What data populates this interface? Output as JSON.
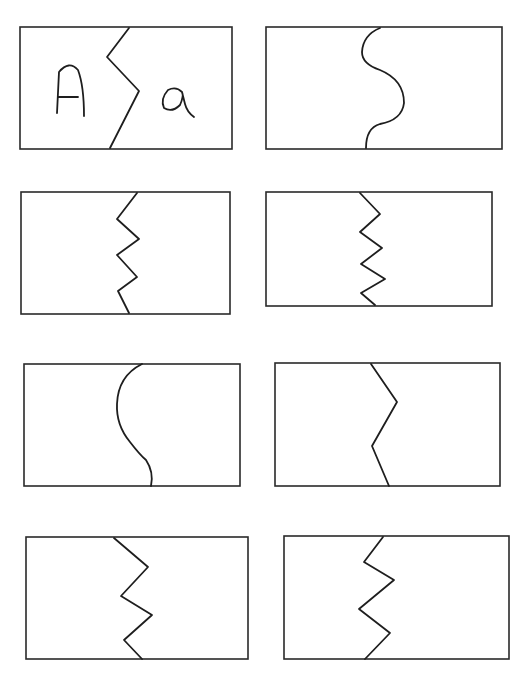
{
  "worksheet": {
    "title": "Uppercase / lowercase matching puzzle cards",
    "cards": [
      {
        "id": 1,
        "left_letter": "A",
        "right_letter": "a",
        "cut_style": "single-zigzag"
      },
      {
        "id": 2,
        "left_letter": "",
        "right_letter": "",
        "cut_style": "s-curve"
      },
      {
        "id": 3,
        "left_letter": "",
        "right_letter": "",
        "cut_style": "zigzag"
      },
      {
        "id": 4,
        "left_letter": "",
        "right_letter": "",
        "cut_style": "zigzag"
      },
      {
        "id": 5,
        "left_letter": "",
        "right_letter": "",
        "cut_style": "curve"
      },
      {
        "id": 6,
        "left_letter": "",
        "right_letter": "",
        "cut_style": "single-zigzag"
      },
      {
        "id": 7,
        "left_letter": "",
        "right_letter": "",
        "cut_style": "zigzag"
      },
      {
        "id": 8,
        "left_letter": "",
        "right_letter": "",
        "cut_style": "zigzag"
      }
    ]
  }
}
